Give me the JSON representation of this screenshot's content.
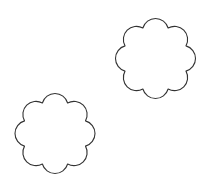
{
  "canvas": {
    "width": 205,
    "height": 187,
    "background": "#ffffff"
  },
  "shapes": [
    {
      "id": "scallop-top-right",
      "type": "scalloped-circle",
      "lobes": 8,
      "cx": 155.5,
      "cy": 58.5,
      "outer_radius": 40,
      "valley_radius": 33,
      "stroke": "#333333",
      "fill": "#ffffff"
    },
    {
      "id": "scallop-bottom-left",
      "type": "scalloped-circle",
      "lobes": 8,
      "cx": 55,
      "cy": 133.5,
      "outer_radius": 40,
      "valley_radius": 33,
      "stroke": "#333333",
      "fill": "#ffffff"
    }
  ]
}
